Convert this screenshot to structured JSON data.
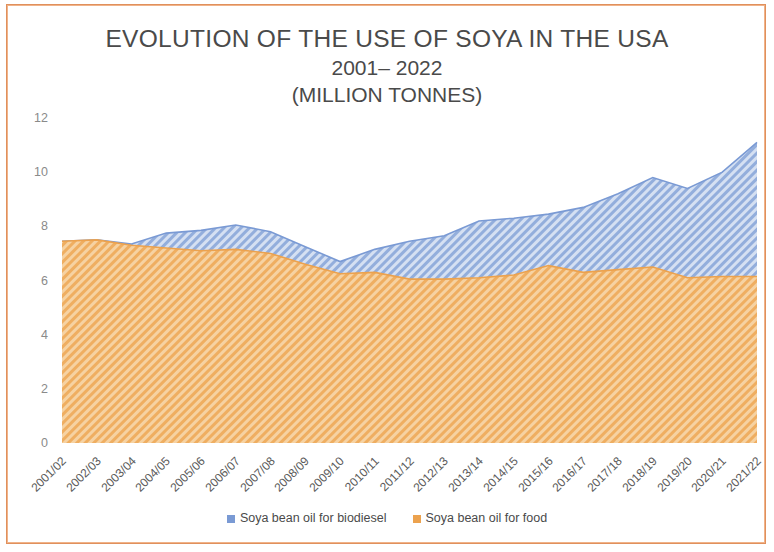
{
  "frame": {
    "border_color": "#E0905C",
    "inner_border_color": "#F0B389"
  },
  "title": {
    "line1": "EVOLUTION OF THE USE OF SOYA IN THE USA",
    "line2": "2001– 2022",
    "line3": "(MILLION TONNES)"
  },
  "legend": {
    "position": "bottom-center",
    "items": [
      {
        "label": "Soya bean oil for biodiesel",
        "color": "#7A9AD4"
      },
      {
        "label": "Soya bean oil for food",
        "color": "#ECA24E"
      }
    ]
  },
  "chart_data": {
    "type": "area",
    "stacked": true,
    "title": "EVOLUTION OF THE USE OF SOYA IN THE USA 2001– 2022 (MILLION TONNES)",
    "xlabel": "",
    "ylabel": "",
    "ylim": [
      0,
      12
    ],
    "yticks": [
      0,
      2,
      4,
      6,
      8,
      10,
      12
    ],
    "grid": false,
    "categories": [
      "2001/02",
      "2002/03",
      "2003/04",
      "2004/05",
      "2005/06",
      "2006/07",
      "2007/08",
      "2008/09",
      "2009/10",
      "2010/11",
      "2011/12",
      "2012/13",
      "2013/14",
      "2014/15",
      "2015/16",
      "2016/17",
      "2017/18",
      "2018/19",
      "2019/20",
      "2020/21",
      "2021/22"
    ],
    "series": [
      {
        "name": "Soya bean oil for food",
        "color": "#ECA24E",
        "fill": "#F4C68A",
        "hatch": "diagonal",
        "values": [
          7.45,
          7.5,
          7.3,
          7.2,
          7.1,
          7.15,
          7.0,
          6.6,
          6.25,
          6.3,
          6.05,
          6.05,
          6.1,
          6.2,
          6.55,
          6.3,
          6.4,
          6.5,
          6.1,
          6.15,
          6.15
        ]
      },
      {
        "name": "Soya bean oil for biodiesel",
        "color": "#7A9AD4",
        "fill": "#A8BEE4",
        "hatch": "diagonal",
        "values": [
          0.0,
          0.0,
          0.05,
          0.55,
          0.75,
          0.9,
          0.8,
          0.65,
          0.45,
          0.85,
          1.4,
          1.6,
          2.1,
          2.1,
          1.9,
          2.4,
          2.8,
          3.3,
          3.3,
          3.85,
          4.95
        ]
      }
    ],
    "totals": [
      7.45,
      7.5,
      7.35,
      7.75,
      7.85,
      8.05,
      7.8,
      7.25,
      6.7,
      7.15,
      7.45,
      7.65,
      8.2,
      8.3,
      8.45,
      8.7,
      9.2,
      9.8,
      9.4,
      10.0,
      11.1
    ]
  }
}
